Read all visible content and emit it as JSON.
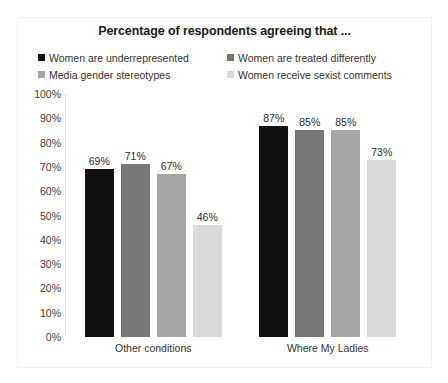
{
  "chart_data": {
    "type": "bar",
    "title": "Percentage of respondents agreeing that ...",
    "categories": [
      "Other conditions",
      "Where My Ladies"
    ],
    "series": [
      {
        "name": "Women are underrepresented",
        "color": "#111111",
        "values": [
          69,
          71
        ]
      },
      {
        "name": "Women are treated differently",
        "color": "#767676",
        "values": [
          71,
          85
        ]
      },
      {
        "name": "Media gender stereotypes",
        "color": "#a6a6a6",
        "values": [
          67,
          85
        ]
      },
      {
        "name": "Women receive sexist comments",
        "color": "#d9d9d9",
        "values": [
          46,
          73
        ]
      }
    ],
    "grouped_values": [
      {
        "category": "Other conditions",
        "values": [
          69,
          71,
          67,
          46
        ],
        "labels": [
          "69%",
          "71%",
          "67%",
          "46%"
        ]
      },
      {
        "category": "Where My Ladies",
        "values": [
          87,
          85,
          85,
          73
        ],
        "labels": [
          "87%",
          "85%",
          "85%",
          "73%"
        ]
      }
    ],
    "xlabel": "",
    "ylabel": "",
    "ylim": [
      0,
      100
    ],
    "yticks": [
      100,
      90,
      80,
      70,
      60,
      50,
      40,
      30,
      20,
      10,
      0
    ],
    "ytick_labels": [
      "100%",
      "90%",
      "80%",
      "70%",
      "60%",
      "50%",
      "40%",
      "30%",
      "20%",
      "10%",
      "0%"
    ],
    "grid": false,
    "legend_position": "top",
    "legend": [
      "Women are underrepresented",
      "Women are treated differently",
      "Media gender stereotypes",
      "Women receive sexist comments"
    ]
  }
}
